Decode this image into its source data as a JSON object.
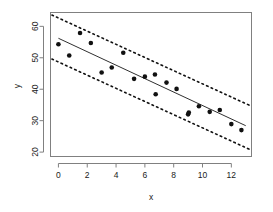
{
  "chart_data": {
    "type": "scatter",
    "title": "",
    "subtitle": "",
    "xlabel": "x",
    "ylabel": "y",
    "xlim": [
      -0.55,
      13.4
    ],
    "ylim": [
      18.6,
      64.4
    ],
    "xticks": [
      0,
      2,
      4,
      6,
      8,
      10,
      12
    ],
    "xticklabels": [
      "0",
      "2",
      "4",
      "6",
      "8",
      "10",
      "12"
    ],
    "yticks": [
      20,
      30,
      40,
      50,
      60
    ],
    "yticklabels": [
      "20",
      "30",
      "40",
      "50",
      "60"
    ],
    "grid": false,
    "legend": null,
    "points": [
      {
        "x": 0.0,
        "y": 54.3
      },
      {
        "x": 0.75,
        "y": 50.7
      },
      {
        "x": 1.5,
        "y": 57.9
      },
      {
        "x": 2.25,
        "y": 54.7
      },
      {
        "x": 3.0,
        "y": 45.3
      },
      {
        "x": 3.7,
        "y": 46.9
      },
      {
        "x": 4.5,
        "y": 51.6
      },
      {
        "x": 5.25,
        "y": 43.3
      },
      {
        "x": 6.0,
        "y": 44.0
      },
      {
        "x": 6.7,
        "y": 44.7
      },
      {
        "x": 6.75,
        "y": 38.4
      },
      {
        "x": 7.5,
        "y": 42.1
      },
      {
        "x": 8.2,
        "y": 40.1
      },
      {
        "x": 9.0,
        "y": 32.0
      },
      {
        "x": 9.05,
        "y": 32.6
      },
      {
        "x": 9.75,
        "y": 34.6
      },
      {
        "x": 10.5,
        "y": 32.8
      },
      {
        "x": 11.2,
        "y": 33.4
      },
      {
        "x": 12.0,
        "y": 28.9
      },
      {
        "x": 12.7,
        "y": 27.0
      }
    ],
    "fit_line": {
      "name": "regression line",
      "style": "solid",
      "x": [
        0.0,
        13.0
      ],
      "y": [
        56.2,
        28.4
      ]
    },
    "bands": [
      {
        "name": "upper prediction band",
        "style": "dotted",
        "x": [
          -0.45,
          13.3
        ],
        "y": [
          63.6,
          34.8
        ]
      },
      {
        "name": "lower prediction band",
        "style": "dotted",
        "x": [
          -0.45,
          13.3
        ],
        "y": [
          49.6,
          20.8
        ]
      }
    ]
  },
  "colors": {
    "point": "#111111",
    "fit": "#303030",
    "band": "#111111",
    "axis": "#808080",
    "text": "#1a1a1a",
    "background": "#ffffff"
  }
}
